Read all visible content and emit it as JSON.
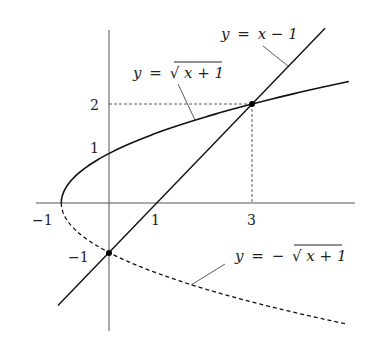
{
  "diagram": {
    "title": "",
    "axes": {
      "x_ticks": [
        {
          "value": -1,
          "label": "−1"
        },
        {
          "value": 1,
          "label": "1"
        },
        {
          "value": 3,
          "label": "3"
        }
      ],
      "y_ticks": [
        {
          "value": 2,
          "label": "2"
        },
        {
          "value": 1,
          "label": "1"
        },
        {
          "value": -1,
          "label": "−1"
        }
      ]
    },
    "curves": [
      {
        "id": "upper-root",
        "label_lhs": "y",
        "label_eq": "=",
        "label_rhs_radical": "√",
        "label_rhs_body": "x + 1",
        "style": "solid",
        "function": "y = sqrt(x+1)",
        "x_range": [
          -1,
          5.03
        ]
      },
      {
        "id": "lower-root",
        "label_lhs": "y",
        "label_eq": "=",
        "label_minus": "−",
        "label_rhs_radical": "√",
        "label_rhs_body": "x + 1",
        "style": "dashed",
        "function": "y = -sqrt(x+1)",
        "x_range": [
          -1,
          4.95
        ]
      },
      {
        "id": "line",
        "label_lhs": "y",
        "label_eq": "=",
        "label_rhs_body": "x − 1",
        "style": "solid",
        "function": "y = x - 1",
        "x_range": [
          -1.07,
          4.53
        ]
      }
    ],
    "intersection_points": [
      {
        "x": 3,
        "y": 2
      },
      {
        "x": 0,
        "y": -1
      }
    ],
    "guide_lines": [
      {
        "from": [
          0,
          2
        ],
        "to": [
          3,
          2
        ],
        "style": "dashed"
      },
      {
        "from": [
          3,
          2
        ],
        "to": [
          3,
          0
        ],
        "style": "dashed"
      }
    ],
    "colors": {
      "ink": "#222222",
      "background": "#ffffff"
    }
  }
}
